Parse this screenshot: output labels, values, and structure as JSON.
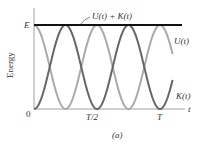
{
  "chart_data": {
    "type": "line",
    "title": "",
    "caption": "(a)",
    "xlabel": "t",
    "ylabel": "Energy",
    "x_ticks": [
      "0",
      "T/2",
      "T"
    ],
    "y_ticks": [
      "0",
      "E"
    ],
    "xlim": [
      0,
      1.2
    ],
    "ylim": [
      0,
      1
    ],
    "grid": false,
    "legend": "inline labels",
    "x": [
      0,
      0.125,
      0.25,
      0.375,
      0.5,
      0.625,
      0.75,
      0.875,
      1.0,
      1.1
    ],
    "series": [
      {
        "name": "U(t) + K(t)",
        "color": "#111111",
        "values": [
          1,
          1,
          1,
          1,
          1,
          1,
          1,
          1,
          1,
          1
        ]
      },
      {
        "name": "U(t)",
        "color": "#aaaaaa",
        "values": [
          1,
          0.5,
          0,
          0.5,
          1,
          0.5,
          0,
          0.5,
          1,
          0.65
        ]
      },
      {
        "name": "K(t)",
        "color": "#666666",
        "values": [
          0,
          0.5,
          1,
          0.5,
          0,
          0.5,
          1,
          0.5,
          0,
          0.35
        ]
      }
    ]
  },
  "labels": {
    "sum": "U(t) + K(t)",
    "u": "U(t)",
    "k": "K(t)",
    "e": "E",
    "zero": "0",
    "half": "T/2",
    "full": "T",
    "t": "t",
    "energy": "Energy",
    "caption": "(a)"
  }
}
